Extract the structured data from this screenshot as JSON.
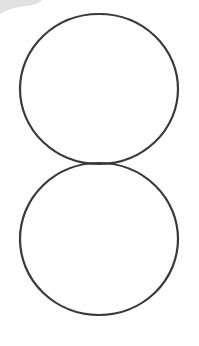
{
  "figure": {
    "background": "#ffffff",
    "stroke_color": "#3a3a3a",
    "stroke_width": 2.2,
    "corner_blob_color": "#d9d9d9",
    "shapes": [
      {
        "type": "circle",
        "name": "top-circle",
        "cx": 99,
        "cy": 89,
        "rx": 79,
        "ry": 75
      },
      {
        "type": "circle",
        "name": "bottom-circle",
        "cx": 99,
        "cy": 239,
        "rx": 79,
        "ry": 76
      }
    ],
    "touch_point": {
      "x": 99,
      "y": 164
    }
  }
}
